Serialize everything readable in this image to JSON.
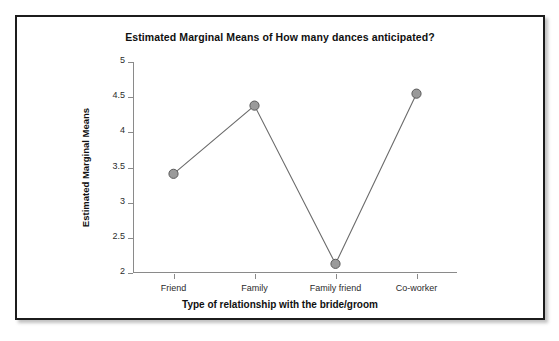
{
  "chart_data": {
    "type": "line",
    "title": "Estimated Marginal Means of How many dances anticipated?",
    "xlabel": "Type of relationship with the bride/groom",
    "ylabel": "Estimated Marginal Means",
    "categories": [
      "Friend",
      "Family",
      "Family friend",
      "Co-worker"
    ],
    "values": [
      3.41,
      4.38,
      2.13,
      4.55
    ],
    "series": [
      {
        "name": "Estimated Marginal Means",
        "values": [
          3.41,
          4.38,
          2.13,
          4.55
        ]
      }
    ],
    "ylim": [
      2,
      5
    ],
    "yticks": [
      "2",
      "2.5",
      "3",
      "3.5",
      "4",
      "4.5",
      "5"
    ],
    "ytick_values": [
      2,
      2.5,
      3,
      3.5,
      4,
      4.5,
      5
    ],
    "grid": false,
    "legend": "none",
    "marker": "circle",
    "marker_color": "#9a9a9a",
    "marker_edge_color": "#5a5a5a",
    "line_color": "#6b6b6b",
    "axis_color": "#8a8a8a",
    "text_color": "#101010",
    "background_color": "#ffffff"
  }
}
